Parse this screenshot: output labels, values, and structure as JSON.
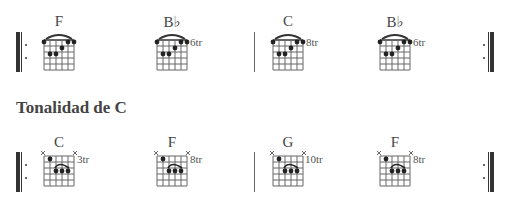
{
  "section_title": "Tonalidad de C",
  "rows": [
    {
      "chords": [
        {
          "name": "F",
          "fret_label": "",
          "type": "barre-e",
          "x": 44
        },
        {
          "name": "B♭",
          "fret_label": "6tr",
          "type": "barre-e",
          "x": 157
        },
        {
          "name": "C",
          "fret_label": "8tr",
          "type": "barre-e",
          "x": 273
        },
        {
          "name": "B♭",
          "fret_label": "6tr",
          "type": "barre-e",
          "x": 380
        }
      ]
    },
    {
      "chords": [
        {
          "name": "C",
          "fret_label": "3tr",
          "type": "barre-a",
          "x": 44
        },
        {
          "name": "F",
          "fret_label": "8tr",
          "type": "barre-a",
          "x": 157
        },
        {
          "name": "G",
          "fret_label": "10tr",
          "type": "barre-a",
          "x": 273
        },
        {
          "name": "F",
          "fret_label": "8tr",
          "type": "barre-a",
          "x": 380
        }
      ]
    }
  ],
  "colors": {
    "ink": "#333333",
    "grid": "#666666"
  }
}
